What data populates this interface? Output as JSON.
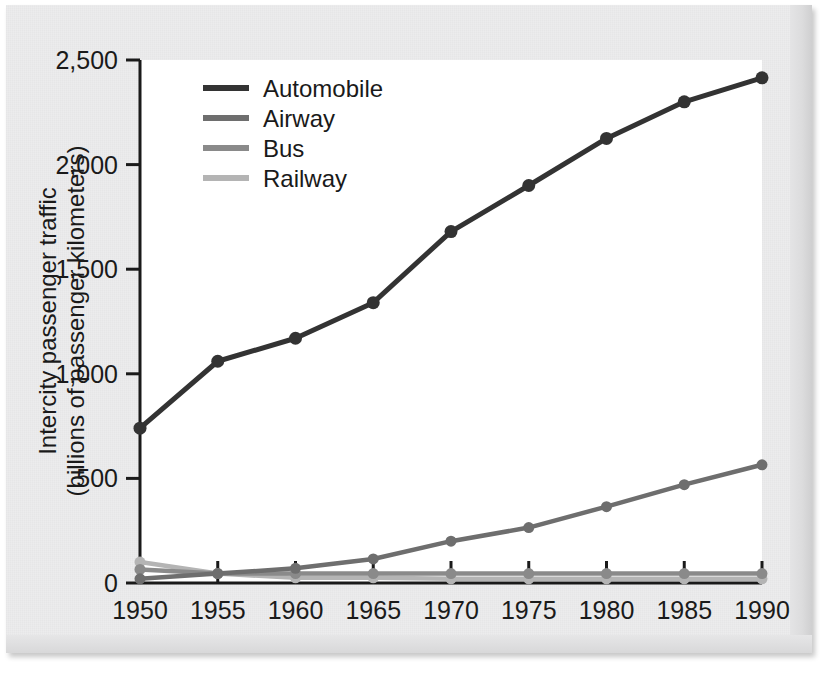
{
  "chart_data": {
    "type": "line",
    "title": "",
    "xlabel": "",
    "ylabel": "Intercity passenger traffic (billions of passenger kilometers)",
    "ylabel_line1": "Intercity passenger traffic",
    "ylabel_line2": "(billions of passenger kilometers)",
    "x": [
      1950,
      1955,
      1960,
      1965,
      1970,
      1975,
      1980,
      1985,
      1990
    ],
    "xtick_labels": [
      "1950",
      "1955",
      "1960",
      "1965",
      "1970",
      "1975",
      "1980",
      "1985",
      "1990"
    ],
    "ytick_values": [
      0,
      500,
      1000,
      1500,
      2000,
      2500
    ],
    "ytick_labels": [
      "0",
      "500",
      "1,000",
      "1,500",
      "2,000",
      "2,500"
    ],
    "xlim": [
      1950,
      1990
    ],
    "ylim": [
      0,
      2500
    ],
    "grid": false,
    "legend_position": "top-left-inside",
    "markers": true,
    "series": [
      {
        "name": "Automobile",
        "color": "#333333",
        "values": [
          740,
          1060,
          1170,
          1340,
          1680,
          1900,
          2125,
          2300,
          2415
        ]
      },
      {
        "name": "Airway",
        "color": "#6e6e6e",
        "values": [
          20,
          45,
          70,
          115,
          200,
          265,
          365,
          470,
          565
        ]
      },
      {
        "name": "Bus",
        "color": "#8a8a8a",
        "values": [
          65,
          45,
          45,
          45,
          45,
          45,
          45,
          45,
          45
        ]
      },
      {
        "name": "Railway",
        "color": "#b4b4b4",
        "values": [
          100,
          45,
          25,
          25,
          20,
          20,
          20,
          20,
          20
        ]
      }
    ]
  },
  "legend": {
    "entries": [
      {
        "label": "Automobile"
      },
      {
        "label": "Airway"
      },
      {
        "label": "Bus"
      },
      {
        "label": "Railway"
      }
    ]
  },
  "colors": {
    "page_background": "#ececed",
    "plot_background": "#ffffff",
    "axis": "#1a1a1a",
    "text": "#1a1a1a"
  }
}
